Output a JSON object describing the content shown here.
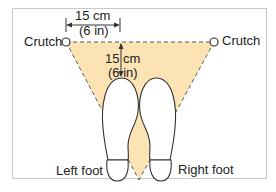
{
  "diagram": {
    "labels": {
      "crutch_left": "Crutch",
      "crutch_right": "Crutch",
      "horizontal_measure_cm": "15 cm",
      "horizontal_measure_in": "(6 in)",
      "vertical_measure_cm": "15 cm",
      "vertical_measure_in": "(6 in)",
      "left_foot": "Left foot",
      "right_foot": "Right foot"
    },
    "colors": {
      "triangle_fill": "#fbe3b4",
      "outline": "#333333",
      "frame_border": "#c9c9c9"
    }
  }
}
